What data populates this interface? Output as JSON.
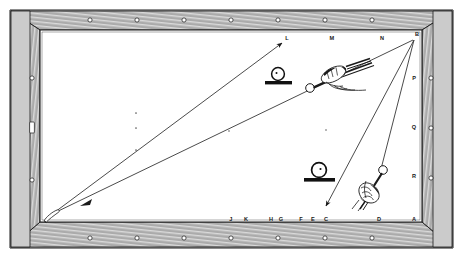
{
  "figure": {
    "caption": "",
    "background_color": "#ffffff",
    "ink_color": "#1a1a1a",
    "rail_color": "#3a3a3a"
  },
  "table": {
    "name": "billiard-table",
    "cloth_color": "#ffffff",
    "frame_label": "wood-grain-rail",
    "outer": {
      "x": 10,
      "y": 10,
      "width": 443,
      "height": 238
    },
    "bed": {
      "x": 38,
      "y": 30,
      "width": 384,
      "height": 192
    }
  },
  "rail_studs": {
    "top_count": 7,
    "bottom_count": 7,
    "left_count": 2,
    "right_count": 3,
    "glyph": "stud-circle"
  },
  "labels": {
    "top": [
      {
        "id": "L",
        "text": "L",
        "x": 287,
        "y": 39
      },
      {
        "id": "M",
        "text": "M",
        "x": 332,
        "y": 39
      },
      {
        "id": "N",
        "text": "N",
        "x": 382,
        "y": 39
      },
      {
        "id": "B",
        "text": "B",
        "x": 415,
        "y": 36
      }
    ],
    "bottom": [
      {
        "id": "J",
        "text": "J",
        "x": 231,
        "y": 221
      },
      {
        "id": "K",
        "text": "K",
        "x": 246,
        "y": 221
      },
      {
        "id": "H",
        "text": "H",
        "x": 271,
        "y": 221
      },
      {
        "id": "G",
        "text": "G",
        "x": 281,
        "y": 221
      },
      {
        "id": "F",
        "text": "F",
        "x": 301,
        "y": 221
      },
      {
        "id": "E",
        "text": "E",
        "x": 313,
        "y": 221
      },
      {
        "id": "C",
        "text": "C",
        "x": 326,
        "y": 221
      },
      {
        "id": "D",
        "text": "D",
        "x": 379,
        "y": 221
      },
      {
        "id": "A",
        "text": "A",
        "x": 414,
        "y": 221
      }
    ],
    "right": [
      {
        "id": "P",
        "text": "P",
        "x": 414,
        "y": 79
      },
      {
        "id": "Q",
        "text": "Q",
        "x": 414,
        "y": 128
      },
      {
        "id": "R",
        "text": "R",
        "x": 414,
        "y": 177
      }
    ]
  },
  "spots": [
    {
      "name": "table-spot-1",
      "x": 136,
      "y": 113
    },
    {
      "name": "table-spot-2",
      "x": 136,
      "y": 128
    },
    {
      "name": "table-spot-3",
      "x": 136,
      "y": 150
    },
    {
      "name": "table-spot-4",
      "x": 229,
      "y": 131
    },
    {
      "name": "table-spot-5",
      "x": 326,
      "y": 130
    }
  ],
  "shot_lines": [
    {
      "name": "stroke-line-to-L",
      "from": {
        "x": 52,
        "y": 214
      },
      "to": {
        "x": 280,
        "y": 41
      },
      "arrow_at": "to"
    },
    {
      "name": "stroke-line-from-B-to-lower-left",
      "from": {
        "x": 413,
        "y": 39
      },
      "to": {
        "x": 48,
        "y": 216
      },
      "arrow_at": "mid"
    },
    {
      "name": "stroke-line-from-B-to-C",
      "from": {
        "x": 414,
        "y": 39
      },
      "to": {
        "x": 324,
        "y": 212
      },
      "arrow_at": "to"
    },
    {
      "name": "stroke-line-from-B-to-D",
      "from": {
        "x": 414,
        "y": 39
      },
      "to": {
        "x": 379,
        "y": 205
      },
      "arrow_at": "none"
    }
  ],
  "ball_markers": [
    {
      "name": "ball-on-stand-upper",
      "cx": 278,
      "cy": 74,
      "r": 6.5,
      "base_y": 83,
      "base_w": 26
    },
    {
      "name": "ball-on-stand-lower",
      "cx": 319,
      "cy": 170,
      "r": 7.5,
      "base_y": 180,
      "base_w": 30
    }
  ],
  "cue_balls": [
    {
      "name": "cue-ball-upper",
      "cx": 310,
      "cy": 88,
      "r": 4.2
    },
    {
      "name": "cue-ball-lower",
      "cx": 383,
      "cy": 170,
      "r": 4.2
    }
  ],
  "hands": [
    {
      "name": "hand-with-cue-upper",
      "x": 318,
      "y": 62
    },
    {
      "name": "hand-with-cue-lower",
      "x": 362,
      "y": 178
    }
  ],
  "cue_tip": {
    "name": "cue-tip-lower-left",
    "x": 45,
    "y": 218
  }
}
